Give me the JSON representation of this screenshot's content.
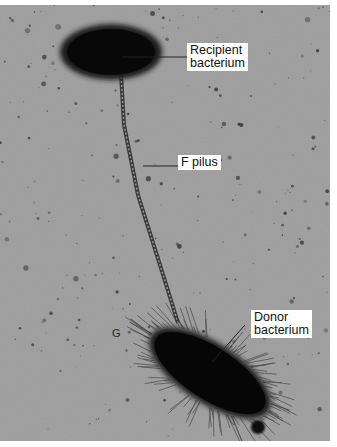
{
  "figure": {
    "background_color": "#9a9a9a",
    "cell_color": "#0b0b0b",
    "labels": {
      "recipient": "Recipient\nbacterium",
      "pilus": "F pilus",
      "donor": "Donor\nbacterium"
    }
  }
}
